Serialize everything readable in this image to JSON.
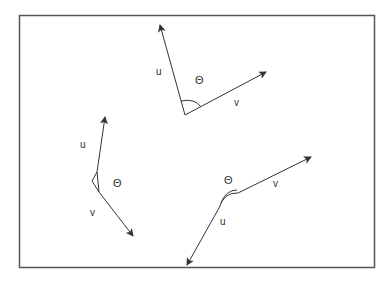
{
  "diagram": {
    "frame": {
      "x": 19,
      "y": 15,
      "width": 355,
      "height": 252,
      "stroke": "#555555"
    },
    "colors": {
      "line": "#333333",
      "text": "#333333"
    },
    "figures": [
      {
        "id": "top",
        "u_label": "u",
        "v_label": "v",
        "angle_label": "Θ",
        "vertex": [
          185,
          115
        ],
        "u_tip": [
          160,
          25
        ],
        "v_tip": [
          266,
          72
        ],
        "labels_pos": {
          "u": [
            156,
            67
          ],
          "angle": [
            195,
            75
          ],
          "v": [
            234,
            98
          ]
        }
      },
      {
        "id": "left",
        "u_label": "u",
        "v_label": "v",
        "angle_label": "Θ",
        "vertex": [
          92,
          181
        ],
        "u_tip": [
          105,
          117
        ],
        "v_tip": [
          133,
          236
        ],
        "labels_pos": {
          "u": [
            80,
            140
          ],
          "angle": [
            113,
            178
          ],
          "v": [
            90,
            208
          ]
        }
      },
      {
        "id": "bottom",
        "u_label": "u",
        "v_label": "v",
        "angle_label": "Θ",
        "vertex": [
          224,
          205
        ],
        "u_tip": [
          187,
          265
        ],
        "v_tip": [
          311,
          157
        ],
        "labels_pos": {
          "u": [
            220,
            217
          ],
          "angle": [
            224,
            175
          ],
          "v": [
            273,
            179
          ]
        }
      }
    ]
  }
}
